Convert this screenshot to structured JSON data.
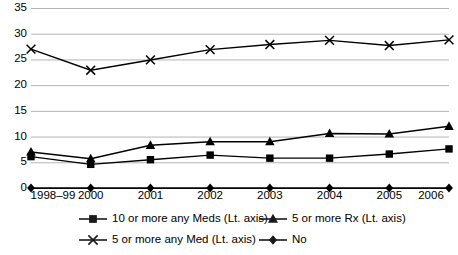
{
  "chart_data": {
    "type": "line",
    "title": "",
    "xlabel": "",
    "ylabel": "",
    "categories": [
      "1998–99",
      "2000",
      "2001",
      "2002",
      "2003",
      "2004",
      "2005",
      "2006"
    ],
    "ylim": [
      0,
      35
    ],
    "ytick_step": 5,
    "yticks": [
      "0",
      "5",
      "10",
      "15",
      "20",
      "25",
      "30",
      "35"
    ],
    "grid": "horizontal",
    "legend_position": "bottom",
    "series": [
      {
        "name": "10 or more any Meds (Lt. axis)",
        "marker": "square",
        "color": "#000000",
        "values": [
          6.1,
          4.6,
          5.5,
          6.4,
          5.8,
          5.8,
          6.6,
          7.6
        ]
      },
      {
        "name": "5 or more Rx (Lt. axis)",
        "marker": "triangle",
        "color": "#000000",
        "values": [
          7.0,
          5.7,
          8.3,
          9.0,
          9.0,
          10.6,
          10.5,
          12.0
        ]
      },
      {
        "name": "5 or more any Med (Lt. axis)",
        "marker": "x",
        "color": "#000000",
        "values": [
          27.0,
          22.9,
          24.9,
          26.9,
          27.9,
          28.7,
          27.7,
          28.8
        ]
      },
      {
        "name": "No",
        "marker": "diamond",
        "color": "#000000",
        "values": [
          0,
          0,
          0,
          0,
          0,
          0,
          0,
          0
        ]
      }
    ]
  },
  "legend": {
    "items": [
      {
        "label": "10 or more any Meds (Lt. axis)",
        "marker": "square"
      },
      {
        "label": "5 or more Rx (Lt. axis)",
        "marker": "triangle"
      },
      {
        "label": "5 or more any Med (Lt. axis)",
        "marker": "x"
      },
      {
        "label": "No",
        "marker": "diamond"
      }
    ]
  },
  "style": {
    "grid_color": "#b4b4b4",
    "line_color": "#1a1a1a",
    "background": "#ffffff"
  }
}
